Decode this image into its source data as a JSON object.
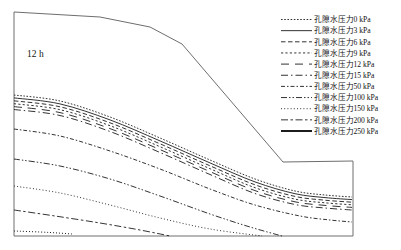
{
  "figure": {
    "background": "#ffffff",
    "contour_color": "#1c1c1c",
    "outline_color": "#6e6e6e",
    "annotation": "12 h"
  },
  "chart_data": {
    "type": "line",
    "subtype": "contour-map",
    "title": "",
    "annotation": "12 h",
    "unit": "kPa",
    "series_name_prefix": "孔隙水压力",
    "legend_position": "top-right",
    "contour_values_kpa": [
      0,
      3,
      6,
      9,
      12,
      15,
      50,
      100,
      150,
      200,
      250
    ],
    "domain_outline": [
      [
        14,
        12
      ],
      [
        100,
        17
      ],
      [
        150,
        27
      ],
      [
        182,
        44
      ],
      [
        283,
        162
      ],
      [
        353,
        161
      ],
      [
        353,
        236
      ],
      [
        14,
        236
      ],
      [
        14,
        12
      ]
    ],
    "contours": [
      {
        "label": "孔隙水压力0 kPa",
        "value_kpa": 0,
        "dash": "1.6 1.6",
        "width": 0.9,
        "points": [
          [
            14,
            95
          ],
          [
            60,
            101
          ],
          [
            110,
            117
          ],
          [
            160,
            138
          ],
          [
            210,
            160
          ],
          [
            255,
            179
          ],
          [
            295,
            191
          ],
          [
            325,
            195
          ],
          [
            352,
            197
          ]
        ]
      },
      {
        "label": "孔隙水压力3 kPa",
        "value_kpa": 3,
        "dash": "",
        "width": 0.9,
        "points": [
          [
            14,
            97.9
          ],
          [
            60,
            103.9
          ],
          [
            110,
            119.9
          ],
          [
            160,
            140.9
          ],
          [
            210,
            162.9
          ],
          [
            255,
            181.9
          ],
          [
            295,
            193.7
          ],
          [
            325,
            197.6
          ],
          [
            352,
            199.6
          ]
        ]
      },
      {
        "label": "孔隙水压力6 kPa",
        "value_kpa": 6,
        "dash": "4.5 2.5",
        "width": 0.9,
        "points": [
          [
            14,
            100.8
          ],
          [
            60,
            106.8
          ],
          [
            110,
            122.8
          ],
          [
            160,
            143.8
          ],
          [
            210,
            165.8
          ],
          [
            255,
            184.8
          ],
          [
            295,
            196.4
          ],
          [
            325,
            200.2
          ],
          [
            352,
            202.2
          ]
        ]
      },
      {
        "label": "孔隙水压力9 kPa",
        "value_kpa": 9,
        "dash": "2.2 2.2",
        "width": 0.9,
        "points": [
          [
            14,
            103.7
          ],
          [
            60,
            109.7
          ],
          [
            110,
            125.7
          ],
          [
            160,
            146.7
          ],
          [
            210,
            168.7
          ],
          [
            255,
            187.7
          ],
          [
            295,
            199.1
          ],
          [
            325,
            202.8
          ],
          [
            352,
            204.8
          ]
        ]
      },
      {
        "label": "孔隙水压力12 kPa",
        "value_kpa": 12,
        "dash": "8 6",
        "width": 0.9,
        "points": [
          [
            14,
            106.6
          ],
          [
            60,
            112.6
          ],
          [
            110,
            128.6
          ],
          [
            160,
            149.6
          ],
          [
            210,
            171.6
          ],
          [
            255,
            190.6
          ],
          [
            295,
            201.8
          ],
          [
            325,
            205.4
          ],
          [
            352,
            207.4
          ]
        ]
      },
      {
        "label": "孔隙水压力15 kPa",
        "value_kpa": 15,
        "dash": "7 3 1.5 3",
        "width": 0.9,
        "points": [
          [
            14,
            109.5
          ],
          [
            60,
            115.5
          ],
          [
            110,
            131.5
          ],
          [
            160,
            152.5
          ],
          [
            210,
            174.5
          ],
          [
            255,
            193.5
          ],
          [
            295,
            204.5
          ],
          [
            325,
            208
          ],
          [
            352,
            210
          ]
        ]
      },
      {
        "label": "孔隙水压力50 kPa",
        "value_kpa": 50,
        "dash": "4 2 1.5 2",
        "width": 0.9,
        "points": [
          [
            14,
            129
          ],
          [
            60,
            136
          ],
          [
            110,
            151
          ],
          [
            160,
            169
          ],
          [
            210,
            189
          ],
          [
            255,
            205
          ],
          [
            300,
            216
          ],
          [
            330,
            220
          ],
          [
            352,
            222
          ]
        ]
      },
      {
        "label": "孔隙水压力100 kPa",
        "value_kpa": 100,
        "dash": "6 2 1.5 2 1.5 2",
        "width": 0.9,
        "points": [
          [
            14,
            159
          ],
          [
            60,
            166
          ],
          [
            110,
            179
          ],
          [
            160,
            196
          ],
          [
            210,
            214
          ],
          [
            250,
            227
          ],
          [
            282,
            236
          ]
        ]
      },
      {
        "label": "孔隙水压力150 kPa",
        "value_kpa": 150,
        "dash": "1 2.2",
        "width": 0.9,
        "points": [
          [
            14,
            186
          ],
          [
            60,
            193
          ],
          [
            110,
            205
          ],
          [
            160,
            218
          ],
          [
            210,
            229
          ],
          [
            262,
            236
          ]
        ]
      },
      {
        "label": "孔隙水压力200 kPa",
        "value_kpa": 200,
        "dash": "7 2.5 2.5 2.5",
        "width": 0.9,
        "points": [
          [
            14,
            210
          ],
          [
            55,
            216
          ],
          [
            100,
            223
          ],
          [
            140,
            230
          ],
          [
            170,
            236
          ]
        ]
      },
      {
        "label": "孔隙水压力250 kPa",
        "value_kpa": 250,
        "dash": "1 2",
        "width": 1,
        "points": [
          [
            14,
            231
          ],
          [
            40,
            232
          ],
          [
            58,
            233
          ],
          [
            72,
            234
          ]
        ],
        "legend_dash": "",
        "legend_width": 2
      }
    ],
    "legend": {
      "x_line_start": 281,
      "x_line_end": 312,
      "x_text": 313.5,
      "y_first_center": 19.5,
      "row_step": 11.15
    }
  }
}
